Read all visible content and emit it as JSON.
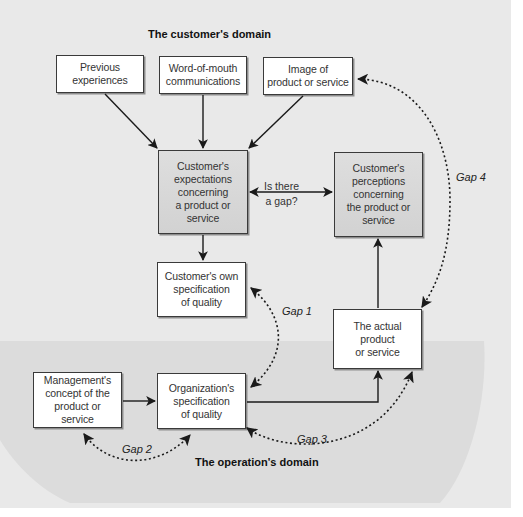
{
  "diagram": {
    "type": "service-quality-gap-model",
    "domains": {
      "customer": "The customer's domain",
      "operation": "The operation's domain"
    },
    "boxes": {
      "previous_experiences": "Previous experiences",
      "word_of_mouth": "Word-of-mouth communications",
      "image": "Image of product or service",
      "expectations": "Customer's expectations concerning a product or service",
      "perceptions": "Customer's perceptions concerning the product or service",
      "own_specification": "Customer's own specification of quality",
      "actual_product": "The actual product or service",
      "management_concept": "Management's concept of the product or service",
      "org_specification": "Organization's specification of quality"
    },
    "box_lines": {
      "previous_experiences": [
        "Previous",
        "experiences"
      ],
      "word_of_mouth": [
        "Word-of-mouth",
        "communications"
      ],
      "image": [
        "Image of",
        "product or service"
      ],
      "expectations": [
        "Customer's",
        "expectations",
        "concerning",
        "a product or",
        "service"
      ],
      "perceptions": [
        "Customer's",
        "perceptions",
        "concerning",
        "the product or",
        "service"
      ],
      "own_specification": [
        "Customer's own",
        "specification",
        "of quality"
      ],
      "actual_product": [
        "The actual",
        "product",
        "or service"
      ],
      "management_concept": [
        "Management's",
        "concept of the",
        "product or service"
      ],
      "org_specification": [
        "Organization's",
        "specification",
        "of quality"
      ]
    },
    "question": {
      "line1": "Is there",
      "line2": "a gap?"
    },
    "gaps": {
      "gap1": "Gap 1",
      "gap2": "Gap 2",
      "gap3": "Gap 3",
      "gap4": "Gap 4"
    },
    "connections": [
      {
        "from": "Previous experiences",
        "to": "Customer's expectations",
        "style": "solid"
      },
      {
        "from": "Word-of-mouth communications",
        "to": "Customer's expectations",
        "style": "solid"
      },
      {
        "from": "Image of product or service",
        "to": "Customer's expectations",
        "style": "solid"
      },
      {
        "from": "Customer's expectations",
        "to": "Customer's perceptions",
        "style": "solid-bidirectional",
        "label": "Is there a gap?"
      },
      {
        "from": "Customer's expectations",
        "to": "Customer's own specification of quality",
        "style": "solid"
      },
      {
        "from": "The actual product or service",
        "to": "Customer's perceptions",
        "style": "solid"
      },
      {
        "from": "Management's concept",
        "to": "Organization's specification of quality",
        "style": "solid"
      },
      {
        "from": "Organization's specification of quality",
        "to": "The actual product or service",
        "style": "solid"
      },
      {
        "between": [
          "Customer's own specification of quality",
          "Organization's specification of quality"
        ],
        "style": "dotted-bidirectional",
        "label": "Gap 1"
      },
      {
        "between": [
          "Management's concept",
          "Organization's specification of quality"
        ],
        "style": "dotted-bidirectional",
        "label": "Gap 2"
      },
      {
        "between": [
          "Organization's specification of quality",
          "The actual product or service"
        ],
        "style": "dotted-bidirectional",
        "label": "Gap 3"
      },
      {
        "between": [
          "Image of product or service",
          "The actual product or service"
        ],
        "style": "dotted-bidirectional",
        "label": "Gap 4"
      }
    ]
  },
  "colors": {
    "canvas": "#e9e9e9",
    "operation_region": "#dcdcdc",
    "box_fill": "#ffffff",
    "box_shaded_fill": "#d6d6d6",
    "line": "#1a1a1a"
  }
}
